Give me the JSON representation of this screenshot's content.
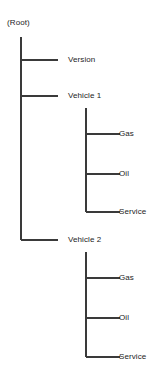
{
  "diagram": {
    "type": "tree",
    "line_color": "#3a3a3a",
    "text_color": "#1c1c1c",
    "root": {
      "label": "(Root)",
      "x": 7,
      "y": 18
    },
    "trunk": {
      "x": 21,
      "y_start": 37,
      "y_end": 240
    },
    "nodes": [
      {
        "id": "version",
        "label": "Version",
        "level": 1,
        "branch_y": 60,
        "stem_x": 21,
        "line_end_x": 58,
        "text_x": 68,
        "terminal": false
      },
      {
        "id": "vehicle-1",
        "label": "Vehicle 1",
        "level": 1,
        "branch_y": 96,
        "stem_x": 21,
        "line_end_x": 58,
        "text_x": 68,
        "terminal": false
      },
      {
        "id": "vehicle-1-gas",
        "label": "Gas",
        "level": 2,
        "branch_y": 134,
        "stem_x": 86,
        "line_end_x": 120,
        "text_x": 119,
        "terminal": false
      },
      {
        "id": "vehicle-1-oil",
        "label": "Oil",
        "level": 2,
        "branch_y": 174,
        "stem_x": 86,
        "line_end_x": 120,
        "text_x": 119,
        "terminal": false
      },
      {
        "id": "vehicle-1-service",
        "label": "Service",
        "level": 2,
        "branch_y": 212,
        "stem_x": 86,
        "line_end_x": 120,
        "text_x": 119,
        "terminal": true
      },
      {
        "id": "vehicle-2",
        "label": "Vehicle 2",
        "level": 1,
        "branch_y": 240,
        "stem_x": 21,
        "line_end_x": 58,
        "text_x": 68,
        "terminal": true
      },
      {
        "id": "vehicle-2-gas",
        "label": "Gas",
        "level": 2,
        "branch_y": 278,
        "stem_x": 86,
        "line_end_x": 120,
        "text_x": 119,
        "terminal": false
      },
      {
        "id": "vehicle-2-oil",
        "label": "Oil",
        "level": 2,
        "branch_y": 318,
        "stem_x": 86,
        "line_end_x": 120,
        "text_x": 119,
        "terminal": false
      },
      {
        "id": "vehicle-2-service",
        "label": "Service",
        "level": 2,
        "branch_y": 357,
        "stem_x": 86,
        "line_end_x": 120,
        "text_x": 119,
        "terminal": true
      }
    ],
    "subtrunks": [
      {
        "id": "vehicle-1-children",
        "x": 86,
        "y_start": 108,
        "y_end": 212
      },
      {
        "id": "vehicle-2-children",
        "x": 86,
        "y_start": 252,
        "y_end": 357
      }
    ]
  }
}
